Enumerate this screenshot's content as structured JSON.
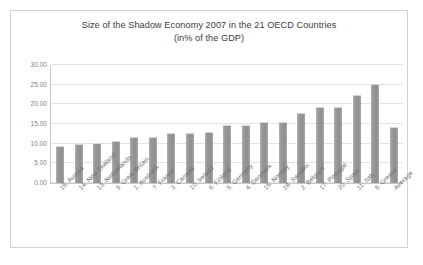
{
  "chart_data": {
    "type": "bar",
    "title": "Size of the Shadow Economy 2007 in the 21 OECD Countries",
    "subtitle": "(in% of the GDP)",
    "xlabel": "",
    "ylabel": "",
    "ylim": [
      0,
      30
    ],
    "ytick_step": 5,
    "grid": true,
    "legend": "none",
    "bar_color": "#9a9a9a",
    "categories": [
      "16. Austria",
      "14. New Zealand",
      "13. Netherlands",
      "9. Great Britain",
      "1. Australia",
      "7. France",
      "3. Canada",
      "10. Ireland",
      "6. Finland",
      "5. Germany",
      "4. Denmark",
      "15. Norway",
      "18. Sweden",
      "2. Belgium",
      "17. Portugal",
      "20. Spain",
      "11. Italy",
      "8. Greece",
      "Average"
    ],
    "values": [
      9.4,
      9.8,
      10.1,
      10.6,
      11.7,
      11.8,
      12.6,
      12.7,
      13.0,
      14.7,
      14.8,
      15.4,
      15.6,
      17.9,
      19.2,
      19.3,
      22.3,
      25.1,
      14.3
    ],
    "ytick_labels": [
      "30.00",
      "25.00",
      "20.00",
      "15.00",
      "10.00",
      "5.00",
      "0.00"
    ],
    "ytick_values": [
      30,
      25,
      20,
      15,
      10,
      5,
      0
    ]
  }
}
